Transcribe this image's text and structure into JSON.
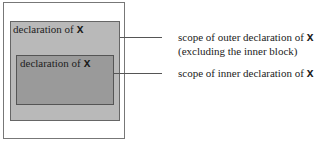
{
  "diagram": {
    "outer_block": {
      "label_text": "declaration of",
      "variable": "x",
      "color": "#b9b9b9"
    },
    "inner_block": {
      "label_text": "declaration of",
      "variable": "x",
      "color": "#9a9a9a"
    },
    "annotations": [
      {
        "text": "scope of outer declaration of",
        "variable": "x",
        "line2": "(excluding the inner block)"
      },
      {
        "text": "scope of inner declaration of",
        "variable": "x"
      }
    ]
  }
}
